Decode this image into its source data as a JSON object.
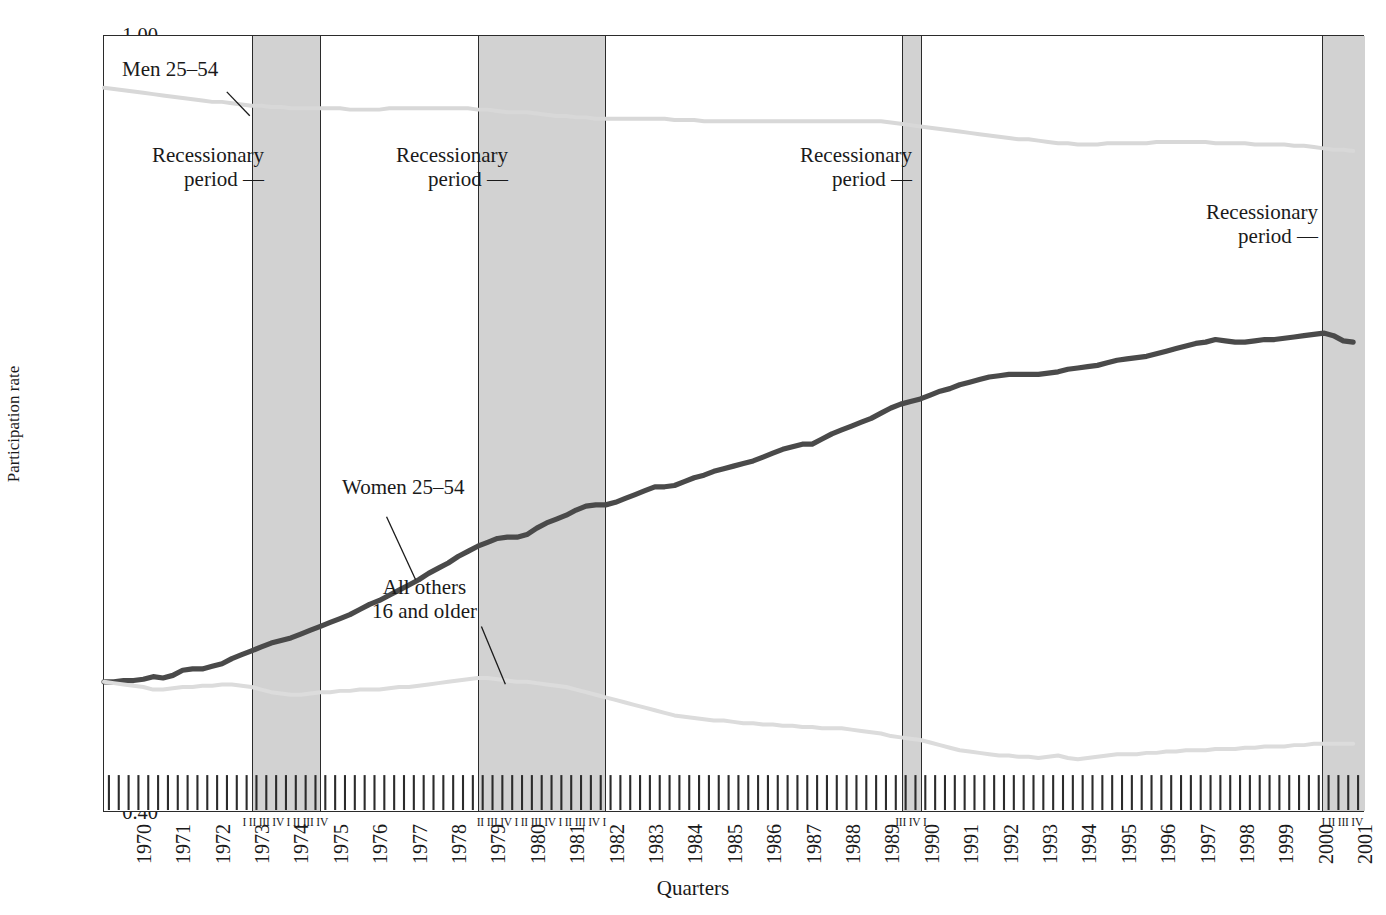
{
  "axes": {
    "ylabel": "Participation rate",
    "xlabel": "Quarters",
    "yticks": [
      "0.40",
      "0.45",
      "0.50",
      "0.55",
      "0.60",
      "0.65",
      "0.70",
      "0.75",
      "0.80",
      "0.85",
      "0.90",
      "0.95",
      "1.00"
    ],
    "xyears": [
      "1970",
      "1971",
      "1972",
      "1973",
      "1974",
      "1975",
      "1976",
      "1977",
      "1978",
      "1979",
      "1980",
      "1981",
      "1982",
      "1983",
      "1984",
      "1985",
      "1986",
      "1987",
      "1988",
      "1989",
      "1990",
      "1991",
      "1992",
      "1993",
      "1994",
      "1995",
      "1996",
      "1997",
      "1998",
      "1999",
      "2000",
      "2001"
    ]
  },
  "annotations": {
    "men": "Men 25–54",
    "women": "Women 25–54",
    "others": "All others\n16 and older",
    "recession1": "Recessionary\nperiod —",
    "recession2": "Recessionary\nperiod —",
    "recession3": "Recessionary\nperiod —",
    "recession4": "Recessionary\nperiod —"
  },
  "recession_quarter_labels": {
    "band1": "I  II III IV I  II III IV",
    "band2": "II III IV I  II III IV  I  II III IV I",
    "band3": "III IV I",
    "band4": "I  II III IV"
  },
  "colors": {
    "women_line": "#4a4a4a",
    "men_line": "#d8d8d8",
    "others_line": "#dcdcdc",
    "recession_band": "#d2d2d2",
    "axis": "#2b2b2b",
    "text": "#1a1a1a"
  },
  "chart_data": {
    "type": "line",
    "title": "",
    "xlabel": "Quarters",
    "ylabel": "Participation rate",
    "xlim": [
      1970.0,
      2002.0
    ],
    "ylim": [
      0.4,
      1.0
    ],
    "grid": false,
    "legend": "in-plot annotations",
    "x_unit": "calendar quarter",
    "x": [
      1970.0,
      1970.25,
      1970.5,
      1970.75,
      1971.0,
      1971.25,
      1971.5,
      1971.75,
      1972.0,
      1972.25,
      1972.5,
      1972.75,
      1973.0,
      1973.25,
      1973.5,
      1973.75,
      1974.0,
      1974.25,
      1974.5,
      1974.75,
      1975.0,
      1975.25,
      1975.5,
      1975.75,
      1976.0,
      1976.25,
      1976.5,
      1976.75,
      1977.0,
      1977.25,
      1977.5,
      1977.75,
      1978.0,
      1978.25,
      1978.5,
      1978.75,
      1979.0,
      1979.25,
      1979.5,
      1979.75,
      1980.0,
      1980.25,
      1980.5,
      1980.75,
      1981.0,
      1981.25,
      1981.5,
      1981.75,
      1982.0,
      1982.25,
      1982.5,
      1982.75,
      1983.0,
      1983.25,
      1983.5,
      1983.75,
      1984.0,
      1984.25,
      1984.5,
      1984.75,
      1985.0,
      1985.25,
      1985.5,
      1985.75,
      1986.0,
      1986.25,
      1986.5,
      1986.75,
      1987.0,
      1987.25,
      1987.5,
      1987.75,
      1988.0,
      1988.25,
      1988.5,
      1988.75,
      1989.0,
      1989.25,
      1989.5,
      1989.75,
      1990.0,
      1990.25,
      1990.5,
      1990.75,
      1991.0,
      1991.25,
      1991.5,
      1991.75,
      1992.0,
      1992.25,
      1992.5,
      1992.75,
      1993.0,
      1993.25,
      1993.5,
      1993.75,
      1994.0,
      1994.25,
      1994.5,
      1994.75,
      1995.0,
      1995.25,
      1995.5,
      1995.75,
      1996.0,
      1996.25,
      1996.5,
      1996.75,
      1997.0,
      1997.25,
      1997.5,
      1997.75,
      1998.0,
      1998.25,
      1998.5,
      1998.75,
      1999.0,
      1999.25,
      1999.5,
      1999.75,
      2000.0,
      2000.25,
      2000.5,
      2000.75,
      2001.0,
      2001.25,
      2001.5,
      2001.75
    ],
    "series": [
      {
        "name": "Men 25–54",
        "color": "#d8d8d8",
        "style": "light",
        "values": [
          0.96,
          0.959,
          0.958,
          0.957,
          0.956,
          0.955,
          0.954,
          0.953,
          0.952,
          0.951,
          0.95,
          0.949,
          0.949,
          0.948,
          0.947,
          0.946,
          0.946,
          0.945,
          0.945,
          0.944,
          0.944,
          0.944,
          0.944,
          0.944,
          0.944,
          0.943,
          0.943,
          0.943,
          0.943,
          0.944,
          0.944,
          0.944,
          0.944,
          0.944,
          0.944,
          0.944,
          0.944,
          0.944,
          0.943,
          0.943,
          0.942,
          0.941,
          0.941,
          0.941,
          0.94,
          0.939,
          0.938,
          0.938,
          0.937,
          0.937,
          0.936,
          0.936,
          0.936,
          0.936,
          0.936,
          0.936,
          0.936,
          0.936,
          0.935,
          0.935,
          0.935,
          0.934,
          0.934,
          0.934,
          0.934,
          0.934,
          0.934,
          0.934,
          0.934,
          0.934,
          0.934,
          0.934,
          0.934,
          0.934,
          0.934,
          0.934,
          0.934,
          0.934,
          0.934,
          0.934,
          0.933,
          0.932,
          0.931,
          0.93,
          0.929,
          0.928,
          0.927,
          0.926,
          0.925,
          0.924,
          0.923,
          0.922,
          0.921,
          0.92,
          0.92,
          0.919,
          0.918,
          0.917,
          0.917,
          0.916,
          0.916,
          0.916,
          0.917,
          0.917,
          0.917,
          0.917,
          0.917,
          0.918,
          0.918,
          0.918,
          0.918,
          0.918,
          0.918,
          0.917,
          0.917,
          0.917,
          0.917,
          0.916,
          0.916,
          0.916,
          0.916,
          0.915,
          0.915,
          0.914,
          0.913,
          0.912,
          0.912,
          0.911
        ]
      },
      {
        "name": "Women 25–54",
        "color": "#4a4a4a",
        "style": "heavy",
        "values": [
          0.5,
          0.5,
          0.501,
          0.501,
          0.502,
          0.504,
          0.503,
          0.505,
          0.509,
          0.51,
          0.51,
          0.512,
          0.514,
          0.518,
          0.521,
          0.524,
          0.527,
          0.53,
          0.532,
          0.534,
          0.537,
          0.54,
          0.543,
          0.546,
          0.549,
          0.552,
          0.556,
          0.56,
          0.563,
          0.567,
          0.571,
          0.575,
          0.579,
          0.584,
          0.588,
          0.592,
          0.597,
          0.601,
          0.605,
          0.608,
          0.611,
          0.612,
          0.612,
          0.614,
          0.619,
          0.623,
          0.626,
          0.629,
          0.633,
          0.636,
          0.637,
          0.637,
          0.639,
          0.642,
          0.645,
          0.648,
          0.651,
          0.651,
          0.652,
          0.655,
          0.658,
          0.66,
          0.663,
          0.665,
          0.667,
          0.669,
          0.671,
          0.674,
          0.677,
          0.68,
          0.682,
          0.684,
          0.684,
          0.688,
          0.692,
          0.695,
          0.698,
          0.701,
          0.704,
          0.708,
          0.712,
          0.715,
          0.717,
          0.719,
          0.722,
          0.725,
          0.727,
          0.73,
          0.732,
          0.734,
          0.736,
          0.737,
          0.738,
          0.738,
          0.738,
          0.738,
          0.739,
          0.74,
          0.742,
          0.743,
          0.744,
          0.745,
          0.747,
          0.749,
          0.75,
          0.751,
          0.752,
          0.754,
          0.756,
          0.758,
          0.76,
          0.762,
          0.763,
          0.765,
          0.764,
          0.763,
          0.763,
          0.764,
          0.765,
          0.765,
          0.766,
          0.767,
          0.768,
          0.769,
          0.77,
          0.768,
          0.764,
          0.763
        ]
      },
      {
        "name": "All others 16 and older",
        "color": "#dcdcdc",
        "style": "light",
        "values": [
          0.5,
          0.499,
          0.498,
          0.497,
          0.496,
          0.494,
          0.494,
          0.495,
          0.496,
          0.496,
          0.497,
          0.497,
          0.498,
          0.498,
          0.497,
          0.496,
          0.494,
          0.492,
          0.491,
          0.49,
          0.49,
          0.491,
          0.492,
          0.492,
          0.493,
          0.493,
          0.494,
          0.494,
          0.494,
          0.495,
          0.496,
          0.496,
          0.497,
          0.498,
          0.499,
          0.5,
          0.501,
          0.502,
          0.503,
          0.503,
          0.502,
          0.501,
          0.5,
          0.5,
          0.499,
          0.498,
          0.497,
          0.496,
          0.494,
          0.492,
          0.49,
          0.488,
          0.486,
          0.484,
          0.482,
          0.48,
          0.478,
          0.476,
          0.474,
          0.473,
          0.472,
          0.471,
          0.47,
          0.47,
          0.469,
          0.468,
          0.468,
          0.467,
          0.467,
          0.466,
          0.466,
          0.465,
          0.465,
          0.464,
          0.464,
          0.464,
          0.463,
          0.462,
          0.461,
          0.46,
          0.458,
          0.457,
          0.456,
          0.455,
          0.453,
          0.451,
          0.449,
          0.447,
          0.446,
          0.445,
          0.444,
          0.443,
          0.443,
          0.442,
          0.442,
          0.441,
          0.442,
          0.443,
          0.441,
          0.44,
          0.441,
          0.442,
          0.443,
          0.444,
          0.444,
          0.444,
          0.445,
          0.445,
          0.446,
          0.446,
          0.447,
          0.447,
          0.447,
          0.448,
          0.448,
          0.448,
          0.449,
          0.449,
          0.45,
          0.45,
          0.45,
          0.451,
          0.451,
          0.452,
          0.452,
          0.452,
          0.452,
          0.452
        ]
      }
    ],
    "recession_bands": [
      {
        "label": "Recessionary period",
        "start": 1973.75,
        "end": 1975.5,
        "quarters": "I II III IV I II III IV"
      },
      {
        "label": "Recessionary period",
        "start": 1979.5,
        "end": 1982.75,
        "quarters": "II III IV I II III IV I II III IV I"
      },
      {
        "label": "Recessionary period",
        "start": 1990.25,
        "end": 1990.75,
        "quarters": "III IV I"
      },
      {
        "label": "Recessionary period",
        "start": 2000.9,
        "end": 2002.0,
        "quarters": "I II III IV"
      }
    ]
  }
}
